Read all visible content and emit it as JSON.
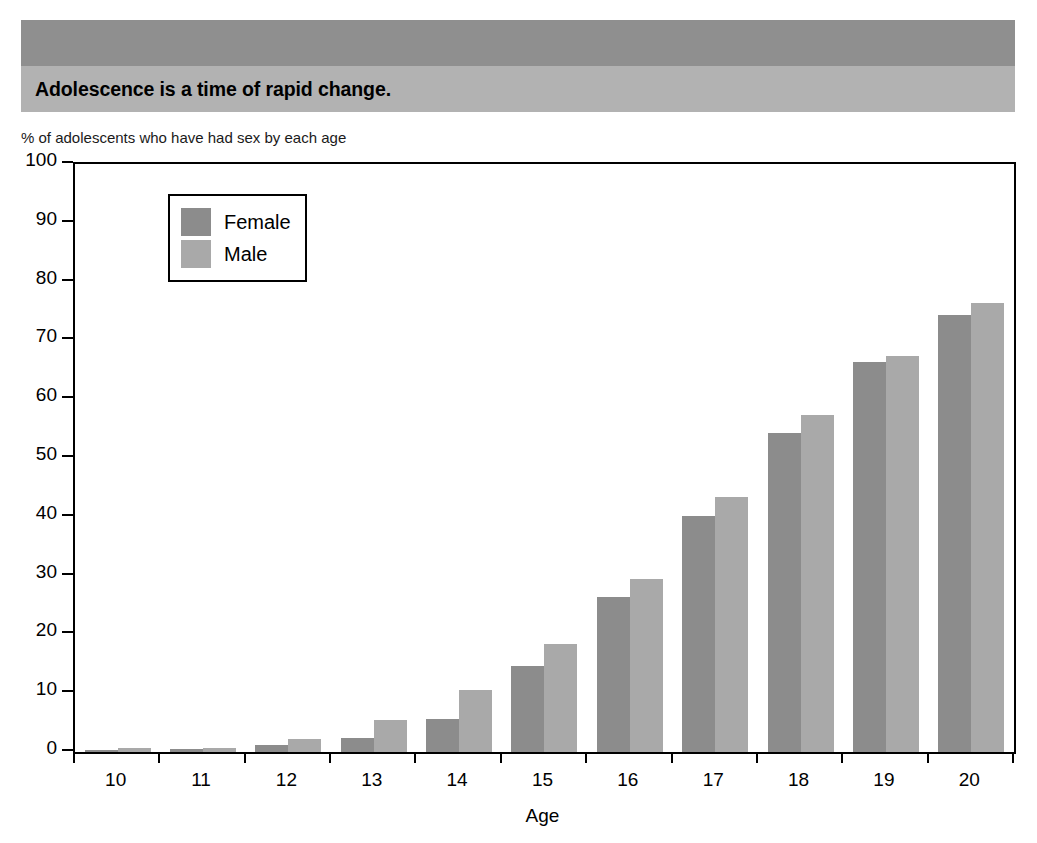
{
  "banner": {
    "title": "Adolescence is a time of rapid change."
  },
  "subtitle": "% of adolescents who have had sex by each age",
  "legend": {
    "items": [
      {
        "label": "Female",
        "color": "#8c8c8c"
      },
      {
        "label": "Male",
        "color": "#a9a9a9"
      }
    ]
  },
  "chart_data": {
    "type": "bar",
    "title": "Adolescence is a time of rapid change.",
    "subtitle": "% of adolescents who have had sex by each age",
    "xlabel": "Age",
    "ylabel": "",
    "ylim": [
      0,
      100
    ],
    "yticks": [
      0,
      10,
      20,
      30,
      40,
      50,
      60,
      70,
      80,
      90,
      100
    ],
    "grid": false,
    "legend_position": "top-left inside plot",
    "categories": [
      "10",
      "11",
      "12",
      "13",
      "14",
      "15",
      "16",
      "17",
      "18",
      "19",
      "20"
    ],
    "series": [
      {
        "name": "Female",
        "color": "#8c8c8c",
        "values": [
          0.4,
          0.5,
          1.2,
          2.3,
          5.6,
          14.6,
          26.3,
          40.2,
          54.3,
          66.4,
          74.4
        ]
      },
      {
        "name": "Male",
        "color": "#a9a9a9",
        "values": [
          0.6,
          0.7,
          2.2,
          5.4,
          10.5,
          18.4,
          29.5,
          43.4,
          57.4,
          67.4,
          76.3
        ]
      }
    ]
  }
}
